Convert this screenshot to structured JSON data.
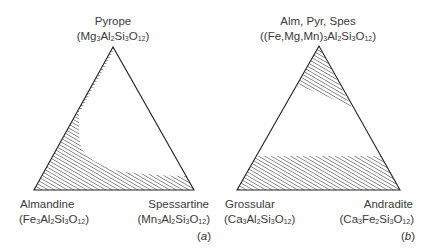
{
  "panels": [
    {
      "id": "a",
      "tag": "a",
      "apex": {
        "name": "Pyrope",
        "formula_parts": [
          "(Mg",
          "3",
          "Al",
          "2",
          "Si",
          "3",
          "O",
          "12",
          ")"
        ]
      },
      "bottom_left": {
        "name": "Almandine",
        "formula_parts": [
          "(Fe",
          "3",
          "Al",
          "2",
          "Si",
          "3",
          "O",
          "12",
          ")"
        ]
      },
      "bottom_right": {
        "name": "Spessartine",
        "formula_parts": [
          "(Mn",
          "3",
          "Al",
          "2",
          "Si",
          "3",
          "O",
          "12",
          ")"
        ]
      },
      "triangle": {
        "apex": [
          113,
          47
        ],
        "bl": [
          34,
          190
        ],
        "br": [
          194,
          190
        ]
      },
      "hatched_regions": [
        {
          "description": "miscibility region along Pyrope-Almandine edge and Almandine-Spessartine base",
          "polygon": [
            [
              113,
              47
            ],
            [
              34,
              190
            ],
            [
              194,
              190
            ],
            [
              186,
              176
            ],
            [
              120,
              172
            ],
            [
              90,
              160
            ],
            [
              80,
              148
            ],
            [
              79,
              112
            ],
            [
              111,
              50
            ]
          ]
        }
      ]
    },
    {
      "id": "b",
      "tag": "b",
      "apex": {
        "name": "Alm, Pyr, Spes",
        "formula_parts": [
          "((Fe,Mg,Mn)",
          "3",
          "Al",
          "2",
          "Si",
          "3",
          "O",
          "12",
          ")"
        ]
      },
      "bottom_left": {
        "name": "Grossular",
        "formula_parts": [
          "(Ca",
          "3",
          "Al",
          "2",
          "Si",
          "3",
          "O",
          "12",
          ")"
        ]
      },
      "bottom_right": {
        "name": "Andradite",
        "formula_parts": [
          "(Ca",
          "3",
          "Fe",
          "2",
          "Si",
          "3",
          "O",
          "12",
          ")"
        ]
      },
      "triangle": {
        "apex": [
          319,
          46
        ],
        "bl": [
          237,
          190
        ],
        "br": [
          400,
          190
        ]
      },
      "hatched_regions": [
        {
          "description": "top region near Alm-Pyr-Spes apex",
          "polygon": [
            [
              319,
              46
            ],
            [
              297,
              85
            ],
            [
              352,
              108
            ]
          ]
        },
        {
          "description": "bottom band along Grossular-Andradite join",
          "polygon": [
            [
              256,
              156
            ],
            [
              237,
              190
            ],
            [
              400,
              190
            ],
            [
              381,
              156
            ]
          ]
        }
      ]
    }
  ]
}
